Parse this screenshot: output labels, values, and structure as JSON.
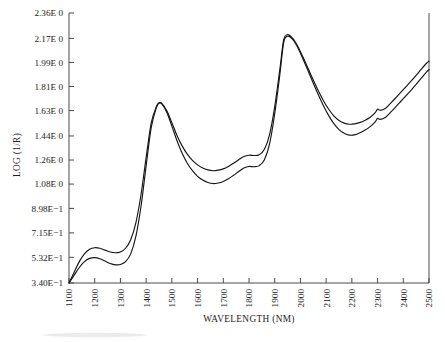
{
  "chart_data": {
    "type": "line",
    "title": "",
    "xlabel": "WAVELENGTH (NM)",
    "ylabel": "LOG (1/R)",
    "xlim": [
      1100,
      2500
    ],
    "ylim": [
      0.34,
      2.36
    ],
    "grid": false,
    "legend": "none",
    "x_tick_labels": [
      "1100",
      "1200",
      "1300",
      "1400",
      "1500",
      "1600",
      "1700",
      "1800",
      "1900",
      "2000",
      "2100",
      "2200",
      "2300",
      "2400",
      "2500"
    ],
    "x_tick_values": [
      1100,
      1200,
      1300,
      1400,
      1500,
      1600,
      1700,
      1800,
      1900,
      2000,
      2100,
      2200,
      2300,
      2400,
      2500
    ],
    "y_tick_labels": [
      "3.40E-1",
      "5.32E-1",
      "7.15E-1",
      "8.98E-1",
      "1.08E 0",
      "1.26E 0",
      "1.44E 0",
      "1.63E 0",
      "1.81E 0",
      "1.99E 0",
      "2.17E 0",
      "2.36E 0"
    ],
    "y_tick_values": [
      0.34,
      0.532,
      0.715,
      0.898,
      1.08,
      1.26,
      1.44,
      1.63,
      1.81,
      1.99,
      2.17,
      2.36
    ],
    "series": [
      {
        "name": "spectrum-upper",
        "color": "#151515",
        "x": [
          1100,
          1120,
          1140,
          1160,
          1180,
          1200,
          1220,
          1240,
          1260,
          1280,
          1300,
          1320,
          1340,
          1360,
          1380,
          1400,
          1420,
          1440,
          1450,
          1460,
          1480,
          1500,
          1520,
          1540,
          1560,
          1580,
          1600,
          1620,
          1640,
          1660,
          1680,
          1700,
          1720,
          1740,
          1760,
          1780,
          1800,
          1820,
          1840,
          1860,
          1880,
          1900,
          1920,
          1935,
          1950,
          1970,
          1990,
          2010,
          2030,
          2050,
          2070,
          2090,
          2110,
          2130,
          2150,
          2170,
          2190,
          2210,
          2230,
          2250,
          2270,
          2290,
          2300,
          2310,
          2330,
          2350,
          2370,
          2390,
          2410,
          2430,
          2450,
          2470,
          2490,
          2500
        ],
        "y": [
          0.34,
          0.42,
          0.5,
          0.558,
          0.592,
          0.604,
          0.6,
          0.586,
          0.572,
          0.566,
          0.572,
          0.6,
          0.664,
          0.79,
          1.0,
          1.28,
          1.54,
          1.66,
          1.688,
          1.686,
          1.63,
          1.54,
          1.444,
          1.366,
          1.304,
          1.258,
          1.224,
          1.2,
          1.186,
          1.18,
          1.184,
          1.194,
          1.212,
          1.236,
          1.262,
          1.286,
          1.296,
          1.294,
          1.3,
          1.34,
          1.45,
          1.66,
          1.94,
          2.16,
          2.198,
          2.17,
          2.11,
          2.03,
          1.944,
          1.858,
          1.776,
          1.702,
          1.64,
          1.59,
          1.556,
          1.536,
          1.528,
          1.53,
          1.54,
          1.556,
          1.578,
          1.612,
          1.64,
          1.632,
          1.646,
          1.684,
          1.724,
          1.766,
          1.808,
          1.85,
          1.894,
          1.94,
          1.984,
          2.0
        ]
      },
      {
        "name": "spectrum-lower",
        "color": "#151515",
        "x": [
          1100,
          1120,
          1140,
          1160,
          1180,
          1200,
          1220,
          1240,
          1260,
          1280,
          1300,
          1320,
          1340,
          1360,
          1380,
          1400,
          1420,
          1440,
          1450,
          1460,
          1480,
          1500,
          1520,
          1540,
          1560,
          1580,
          1600,
          1620,
          1640,
          1660,
          1680,
          1700,
          1720,
          1740,
          1760,
          1780,
          1800,
          1820,
          1840,
          1860,
          1880,
          1900,
          1920,
          1935,
          1950,
          1970,
          1990,
          2010,
          2030,
          2050,
          2070,
          2090,
          2110,
          2130,
          2150,
          2170,
          2190,
          2210,
          2230,
          2250,
          2270,
          2290,
          2300,
          2310,
          2330,
          2350,
          2370,
          2390,
          2410,
          2430,
          2450,
          2470,
          2490,
          2500
        ],
        "y": [
          0.34,
          0.398,
          0.456,
          0.5,
          0.524,
          0.53,
          0.522,
          0.504,
          0.486,
          0.476,
          0.478,
          0.5,
          0.558,
          0.688,
          0.912,
          1.216,
          1.506,
          1.652,
          1.684,
          1.682,
          1.618,
          1.514,
          1.404,
          1.31,
          1.236,
          1.18,
          1.138,
          1.11,
          1.092,
          1.084,
          1.088,
          1.1,
          1.12,
          1.146,
          1.174,
          1.2,
          1.212,
          1.21,
          1.218,
          1.262,
          1.38,
          1.606,
          1.9,
          2.14,
          2.186,
          2.162,
          2.1,
          2.016,
          1.926,
          1.834,
          1.746,
          1.664,
          1.592,
          1.532,
          1.488,
          1.46,
          1.446,
          1.448,
          1.462,
          1.482,
          1.508,
          1.544,
          1.572,
          1.564,
          1.578,
          1.616,
          1.656,
          1.698,
          1.74,
          1.782,
          1.826,
          1.872,
          1.918,
          1.936
        ]
      }
    ]
  }
}
